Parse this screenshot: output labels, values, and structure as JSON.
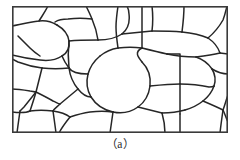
{
  "figure": {
    "caption": "（a）",
    "panel_label": "a",
    "alt_description": "Schematic of polycrystalline grain structure with irregular grain boundaries enclosed in a rectangular frame",
    "colors": {
      "background": "#ffffff",
      "frame_stroke": "#3a3a3a",
      "boundary_stroke": "#262626",
      "grain_fill": "#ffffff",
      "caption_text": "#2b2b2b"
    },
    "panel": {
      "x": 12,
      "y": 6,
      "width": 216,
      "height": 127,
      "frame_stroke_width": 1.6,
      "boundary_stroke_width": 1.5
    }
  },
  "chart_data": {
    "type": "diagram",
    "title": "",
    "subtitle": "",
    "xlabel": "",
    "ylabel": "",
    "grid": false,
    "legend": "none",
    "view_box": [
      0,
      0,
      216,
      127
    ],
    "grain_count": 38,
    "boundary_paths": [
      "M 0 0 L 216 0 L 216 127 L 0 127 Z",
      "M 0 20 C 10 18 18 16 27 15 C 34 14 40 16 45 19",
      "M 45 19 C 52 23 56 28 57 35",
      "M 57 35 C 58 42 55 47 50 50",
      "M 50 50 C 44 54 36 55 28 54 C 18 53 8 51 0 49",
      "M 0 49 L 0 20",
      "M 27 15 C 30 10 33 6 36 0",
      "M 57 35 C 66 34 76 34 86 34",
      "M 86 34 C 96 34 104 32 110 28",
      "M 110 28 C 116 23 118 16 117 8 C 117 4 116 2 115 0",
      "M 86 34 C 85 27 83 20 80 13 C 78 8 76 4 74 0",
      "M 80 13 C 72 12 64 12 56 13 C 50 13 46 14 43 16",
      "M 110 28 C 120 27 130 26 140 25",
      "M 140 25 C 141 17 141 9 140 0",
      "M 140 25 C 150 25 160 25 170 26",
      "M 170 26 C 171 18 172 9 172 0",
      "M 170 26 C 180 27 189 29 196 32",
      "M 196 32 C 202 27 207 21 211 14 C 213 9 214 4 215 0",
      "M 196 32 C 202 36 206 41 208 47",
      "M 208 47 L 216 48",
      "M 208 47 C 200 49 192 50 184 51",
      "M 184 51 C 174 51 164 50 155 48",
      "M 155 48 C 146 46 138 44 130 42",
      "M 130 42 C 122 41 114 41 106 42",
      "M 106 42 C 99 43 93 46 88 50",
      "M 88 50 C 82 55 78 61 76 68",
      "M 76 68 C 74 76 75 84 79 91",
      "M 79 91 C 84 99 92 104 101 106",
      "M 101 106 C 110 108 119 106 126 101",
      "M 126 101 C 133 96 137 88 138 80",
      "M 138 80 C 139 71 136 62 130 56",
      "M 130 56 C 126 51 122 46 130 42",
      "M 57 35 C 56 44 56 53 57 62",
      "M 57 62 C 58 70 61 77 66 83",
      "M 66 83 C 70 88 74 91 79 91",
      "M 57 62 C 48 63 39 63 30 62",
      "M 30 62 C 22 61 14 59 6 56 C 4 55 2 54 0 53",
      "M 50 50 C 52 55 54 58 57 62",
      "M 30 62 C 28 70 26 78 24 86",
      "M 24 86 C 22 93 20 99 18 105",
      "M 18 105 C 14 107 8 107 0 106",
      "M 18 105 C 25 104 33 104 41 105",
      "M 41 105 C 48 106 54 108 58 111",
      "M 58 111 C 54 116 50 121 47 127",
      "M 58 111 C 64 109 71 107 78 106 C 86 105 94 105 101 106",
      "M 66 83 C 60 88 54 93 48 98 C 45 101 42 103 41 105",
      "M 24 86 C 20 91 16 96 12 101 C 10 103 9 104 8 105",
      "M 0 83 C 6 83 12 84 18 85 C 20 85 22 86 24 86",
      "M 126 101 C 134 103 142 105 150 107",
      "M 150 107 C 152 114 153 121 153 127",
      "M 150 107 C 158 107 166 106 173 104",
      "M 173 104 C 180 102 186 99 191 95",
      "M 191 95 C 196 91 200 86 202 80",
      "M 202 80 C 204 74 203 68 200 63",
      "M 200 63 C 196 57 190 53 184 51",
      "M 138 80 C 148 79 158 78 168 78",
      "M 168 78 C 178 78 188 79 197 81 C 199 81 201 81 202 80",
      "M 168 78 C 168 68 168 58 168 48 C 168 48 166 48 155 48",
      "M 168 78 C 168 88 168 98 168 108",
      "M 168 108 C 168 115 168 121 168 127",
      "M 191 95 C 198 98 205 101 211 104",
      "M 211 104 C 213 99 214 94 216 89",
      "M 211 104 C 210 111 209 118 208 127",
      "M 211 104 C 213 108 214 112 216 116",
      "M 101 106 C 100 113 99 120 98 127",
      "M 76 68 C 68 68 60 67 57 62",
      "M 106 42 C 105 35 104 28 104 21 C 104 14 105 7 106 0",
      "M 130 42 C 130 34 130 26 130 18 C 130 12 130 6 130 0",
      "M 216 68 C 210 68 205 66 200 63",
      "M 6 30 C 10 34 14 38 18 42 C 21 45 25 48 28 50",
      "M 41 105 C 42 112 43 119 44 127",
      "M 8 105 C 7 112 6 119 5 127",
      "M 24 86 C 30 89 36 92 41 95 C 44 96 46 98 48 98"
    ],
    "annotations": [
      {
        "text": "（a）",
        "position": "below-panel",
        "align": "center"
      }
    ]
  }
}
